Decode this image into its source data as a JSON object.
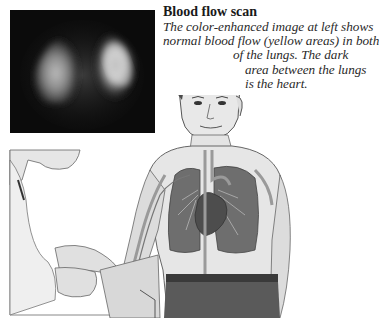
{
  "caption": {
    "title": "Blood flow scan",
    "lines": [
      "The color-enhanced image at left shows",
      "normal blood flow (yellow areas) in both",
      "of the lungs. The dark",
      "area between the lungs",
      "is the heart."
    ]
  },
  "figures": {
    "scan": {
      "label": "lung perfusion scan image"
    },
    "illustration": {
      "label": "technician injecting tracer into patient's arm; lungs, heart and blood vessels shown in chest"
    }
  },
  "colors": {
    "background": "#ffffff",
    "text": "#1a1a1a",
    "scan_bg": "#0b0b0b"
  }
}
